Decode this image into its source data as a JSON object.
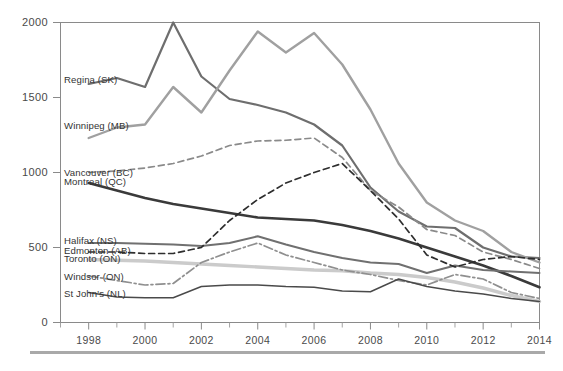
{
  "chart_data": {
    "type": "line",
    "title": "",
    "subtitle": "",
    "xlabel": "",
    "ylabel": "",
    "xlim": [
      1997,
      2014
    ],
    "ylim": [
      0,
      2000
    ],
    "yticks": [
      0,
      500,
      1000,
      1500,
      2000
    ],
    "ytick_labels": [
      "0",
      "500",
      "1000",
      "1500",
      "2000"
    ],
    "xticks": [
      1998,
      2000,
      2002,
      2004,
      2006,
      2008,
      2010,
      2012,
      2014
    ],
    "xtick_labels": [
      "1998",
      "2000",
      "2002",
      "2004",
      "2006",
      "2008",
      "2010",
      "2012",
      "2014"
    ],
    "x_minor_ticks": [
      1997,
      1999,
      2001,
      2003,
      2005,
      2007,
      2009,
      2011,
      2013
    ],
    "grid": false,
    "legend_position": "inline-left-labels",
    "x": [
      1998,
      1999,
      2000,
      2001,
      2002,
      2003,
      2004,
      2005,
      2006,
      2007,
      2008,
      2009,
      2010,
      2011,
      2012,
      2013,
      2014
    ],
    "series": [
      {
        "name": "Regina (SK)",
        "label": "Regina (SK)",
        "color": "#6e6e6e",
        "width": 2.2,
        "dash": "none",
        "label_y_value": 1620,
        "values": [
          1590,
          1630,
          1570,
          2000,
          1640,
          1490,
          1450,
          1400,
          1320,
          1180,
          900,
          740,
          640,
          630,
          500,
          440,
          430
        ]
      },
      {
        "name": "Winnipeg (MB)",
        "label": "Winnipeg (MB)",
        "color": "#a0a0a0",
        "width": 2.4,
        "dash": "none",
        "label_y_value": 1310,
        "values": [
          1230,
          1300,
          1320,
          1570,
          1400,
          1680,
          1940,
          1800,
          1930,
          1720,
          1420,
          1060,
          800,
          680,
          610,
          470,
          400
        ]
      },
      {
        "name": "Vancouver (BC)",
        "label": "Vancouver (BC)",
        "color": "#8a8a8a",
        "width": 1.7,
        "dash": "6 4",
        "label_y_value": 1000,
        "values": [
          1000,
          1010,
          1030,
          1060,
          1110,
          1180,
          1210,
          1215,
          1230,
          1100,
          880,
          770,
          620,
          580,
          470,
          420,
          360
        ]
      },
      {
        "name": "Montreal (QC)",
        "label": "Montreal (QC)",
        "color": "#3a3a3a",
        "width": 2.6,
        "dash": "none",
        "label_y_value": 940,
        "values": [
          930,
          880,
          830,
          790,
          760,
          730,
          700,
          690,
          680,
          650,
          610,
          560,
          500,
          440,
          380,
          310,
          235
        ]
      },
      {
        "name": "Halifax (NS)",
        "label": "Halifax (NS)",
        "color": "#707070",
        "width": 2.0,
        "dash": "none",
        "label_y_value": 545,
        "values": [
          530,
          530,
          525,
          520,
          510,
          530,
          575,
          520,
          470,
          430,
          400,
          390,
          330,
          380,
          350,
          340,
          330
        ]
      },
      {
        "name": "Edmonton (AB)",
        "label": "Edmonton (AB)",
        "color": "#2e2e2e",
        "width": 1.7,
        "dash": "6 4",
        "label_y_value": 480,
        "values": [
          470,
          470,
          460,
          460,
          500,
          680,
          820,
          930,
          1000,
          1060,
          880,
          690,
          450,
          370,
          420,
          440,
          420
        ]
      },
      {
        "name": "Toronto (ON)",
        "label": "Toronto (ON)",
        "color": "#cbcbcb",
        "width": 3.4,
        "dash": "none",
        "label_y_value": 425,
        "values": [
          420,
          415,
          410,
          400,
          390,
          380,
          370,
          360,
          350,
          345,
          330,
          320,
          300,
          270,
          230,
          180,
          140
        ]
      },
      {
        "name": "Windsor (ON)",
        "label": "Windsor (ON)",
        "color": "#8f8f8f",
        "width": 1.7,
        "dash": "9 3 2 3",
        "label_y_value": 305,
        "values": [
          310,
          280,
          250,
          260,
          400,
          470,
          530,
          450,
          400,
          350,
          320,
          280,
          250,
          320,
          290,
          200,
          160
        ]
      },
      {
        "name": "St John's (NL)",
        "label": "St John's (NL)",
        "color": "#4a4a4a",
        "width": 1.4,
        "dash": "none",
        "label_y_value": 195,
        "values": [
          200,
          170,
          165,
          165,
          240,
          250,
          250,
          240,
          235,
          210,
          205,
          290,
          240,
          210,
          190,
          160,
          140
        ]
      }
    ]
  }
}
